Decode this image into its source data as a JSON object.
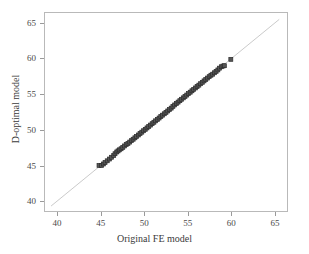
{
  "chart_data": {
    "type": "scatter",
    "title": "",
    "xlabel": "Original FE model",
    "ylabel": "D-optimal model",
    "xlim": [
      38.5,
      66.5
    ],
    "ylim": [
      38.5,
      66.5
    ],
    "xticks": [
      40,
      45,
      50,
      55,
      60,
      65
    ],
    "yticks": [
      40,
      45,
      50,
      55,
      60,
      65
    ],
    "xtick_labels": [
      "40",
      "45",
      "50",
      "55",
      "60",
      "65"
    ],
    "ytick_labels": [
      "40",
      "45",
      "50",
      "55",
      "60",
      "65"
    ],
    "grid": false,
    "legend": "none",
    "marker": "square",
    "marker_color": "#555555",
    "marker_edge_color": "#2b2b2b",
    "marker_size": 4,
    "reference_line": {
      "label": "1:1 identity line",
      "x": [
        39.2,
        65.6
      ],
      "y": [
        39.2,
        65.6
      ],
      "color": "#c9c9c9",
      "width": 1
    },
    "points": [
      {
        "x": 44.75,
        "y": 44.95
      },
      {
        "x": 45.05,
        "y": 44.95
      },
      {
        "x": 45.25,
        "y": 45.15
      },
      {
        "x": 45.45,
        "y": 45.35
      },
      {
        "x": 45.7,
        "y": 45.6
      },
      {
        "x": 45.95,
        "y": 45.85
      },
      {
        "x": 46.2,
        "y": 46.1
      },
      {
        "x": 46.45,
        "y": 46.35
      },
      {
        "x": 46.6,
        "y": 46.6
      },
      {
        "x": 46.8,
        "y": 46.85
      },
      {
        "x": 46.95,
        "y": 47.0
      },
      {
        "x": 47.1,
        "y": 47.15
      },
      {
        "x": 47.3,
        "y": 47.3
      },
      {
        "x": 47.5,
        "y": 47.5
      },
      {
        "x": 47.7,
        "y": 47.7
      },
      {
        "x": 47.9,
        "y": 47.9
      },
      {
        "x": 48.1,
        "y": 48.05
      },
      {
        "x": 48.3,
        "y": 48.25
      },
      {
        "x": 48.5,
        "y": 48.45
      },
      {
        "x": 48.7,
        "y": 48.65
      },
      {
        "x": 48.9,
        "y": 48.85
      },
      {
        "x": 49.1,
        "y": 49.05
      },
      {
        "x": 49.3,
        "y": 49.25
      },
      {
        "x": 49.5,
        "y": 49.45
      },
      {
        "x": 49.7,
        "y": 49.65
      },
      {
        "x": 49.9,
        "y": 49.85
      },
      {
        "x": 50.1,
        "y": 50.05
      },
      {
        "x": 50.3,
        "y": 50.25
      },
      {
        "x": 50.5,
        "y": 50.45
      },
      {
        "x": 50.7,
        "y": 50.65
      },
      {
        "x": 50.9,
        "y": 50.85
      },
      {
        "x": 51.1,
        "y": 51.05
      },
      {
        "x": 51.3,
        "y": 51.25
      },
      {
        "x": 51.5,
        "y": 51.45
      },
      {
        "x": 51.7,
        "y": 51.65
      },
      {
        "x": 51.9,
        "y": 51.85
      },
      {
        "x": 52.1,
        "y": 52.05
      },
      {
        "x": 52.3,
        "y": 52.25
      },
      {
        "x": 52.5,
        "y": 52.45
      },
      {
        "x": 52.7,
        "y": 52.65
      },
      {
        "x": 52.9,
        "y": 52.85
      },
      {
        "x": 53.1,
        "y": 53.05
      },
      {
        "x": 53.3,
        "y": 53.3
      },
      {
        "x": 53.5,
        "y": 53.5
      },
      {
        "x": 53.7,
        "y": 53.7
      },
      {
        "x": 53.9,
        "y": 53.9
      },
      {
        "x": 54.1,
        "y": 54.1
      },
      {
        "x": 54.3,
        "y": 54.3
      },
      {
        "x": 54.5,
        "y": 54.5
      },
      {
        "x": 54.7,
        "y": 54.7
      },
      {
        "x": 54.9,
        "y": 54.9
      },
      {
        "x": 55.1,
        "y": 55.1
      },
      {
        "x": 55.3,
        "y": 55.3
      },
      {
        "x": 55.5,
        "y": 55.5
      },
      {
        "x": 55.7,
        "y": 55.7
      },
      {
        "x": 55.9,
        "y": 55.9
      },
      {
        "x": 56.1,
        "y": 56.1
      },
      {
        "x": 56.3,
        "y": 56.3
      },
      {
        "x": 56.5,
        "y": 56.5
      },
      {
        "x": 56.7,
        "y": 56.7
      },
      {
        "x": 56.9,
        "y": 56.9
      },
      {
        "x": 57.1,
        "y": 57.1
      },
      {
        "x": 57.3,
        "y": 57.3
      },
      {
        "x": 57.5,
        "y": 57.5
      },
      {
        "x": 57.7,
        "y": 57.7
      },
      {
        "x": 57.9,
        "y": 57.85
      },
      {
        "x": 58.1,
        "y": 58.05
      },
      {
        "x": 58.3,
        "y": 58.25
      },
      {
        "x": 58.5,
        "y": 58.45
      },
      {
        "x": 58.7,
        "y": 58.7
      },
      {
        "x": 58.9,
        "y": 58.9
      },
      {
        "x": 59.1,
        "y": 59.0
      },
      {
        "x": 59.25,
        "y": 59.05
      },
      {
        "x": 60.0,
        "y": 59.95
      }
    ]
  }
}
